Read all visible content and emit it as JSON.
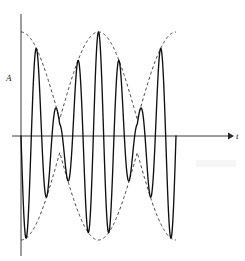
{
  "figure": {
    "background_color": "#ffffff",
    "wave_color": "#111111",
    "envelope_color": "#222222",
    "axis_color": "#333333",
    "width": 245,
    "height": 261
  },
  "axes": {
    "vertical_label": "A",
    "horizontal_label": "t",
    "origin_x": 21,
    "baseline_y": 136,
    "y_axis_top": 14,
    "y_axis_bottom": 256,
    "x_axis_end": 230,
    "arrowhead": "right-arrow-icon"
  },
  "chart_data": {
    "type": "line",
    "xlabel": "t",
    "ylabel": "A",
    "grid": false,
    "legend": false,
    "xlim": [
      0,
      6.2832
    ],
    "ylim": [
      -1.05,
      1.05
    ],
    "baseline": 0,
    "series": [
      {
        "name": "carrier",
        "style": "solid",
        "description": "High frequency carrier modulated by a cosine envelope; y = cos(7.5 t) * cos(t - pi/2) shape producing two loud loops and one node",
        "carrier_cycles": 24,
        "carrier_frequency": 7.5,
        "envelope_frequency": 1.0
      },
      {
        "name": "envelope-upper",
        "style": "dashed",
        "description": "Upper amplitude envelope, dashed"
      },
      {
        "name": "envelope-lower",
        "style": "dashed",
        "description": "Lower amplitude envelope, dashed"
      }
    ],
    "annotations": [
      {
        "text": "A",
        "x": 0,
        "y": 0.75,
        "role": "amplitude-axis-label"
      },
      {
        "text": "t",
        "x": 6.2,
        "y": 0,
        "role": "time-axis-label"
      }
    ],
    "features": {
      "antinodes": 2,
      "nodes": 1,
      "node_position_fraction": 0.5,
      "max_amplitude": 1.0,
      "min_amplitude_at_node": 0.16
    }
  }
}
